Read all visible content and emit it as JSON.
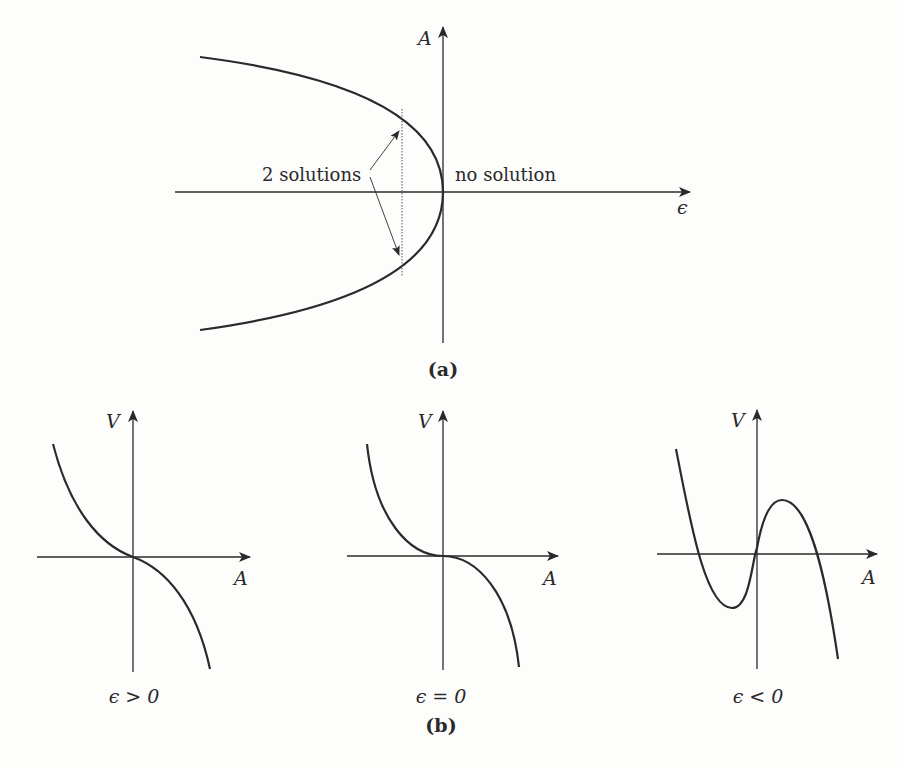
{
  "figure": {
    "panel_a": {
      "caption": "(a)",
      "y_axis_label": "A",
      "x_axis_label": "ϵ",
      "annotation_left": "2 solutions",
      "annotation_right": "no solution"
    },
    "panel_b": {
      "caption": "(b)",
      "subplots": [
        {
          "y_axis_label": "V",
          "x_axis_label": "A",
          "condition": "ϵ > 0"
        },
        {
          "y_axis_label": "V",
          "x_axis_label": "A",
          "condition": "ϵ = 0"
        },
        {
          "y_axis_label": "V",
          "x_axis_label": "A",
          "condition": "ϵ < 0"
        }
      ]
    }
  },
  "colors": {
    "ink": "#2a2a2a",
    "background": "#fdfdfc"
  }
}
